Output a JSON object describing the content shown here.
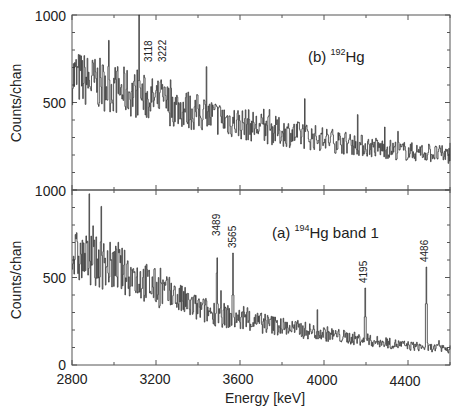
{
  "chart_data": [
    {
      "type": "line",
      "panel": "b",
      "title": "(b) 192Hg",
      "title_parts": {
        "prefix": "(b) ",
        "mass": "192",
        "element": "Hg"
      },
      "xlabel": "Energy [keV]",
      "ylabel": "Counts/chan",
      "xlim": [
        2800,
        4600
      ],
      "ylim": [
        0,
        1000
      ],
      "yticks": [
        {
          "value": 500,
          "label": "500"
        },
        {
          "value": 1000,
          "label": "1000"
        }
      ],
      "bottom_label": "1000",
      "peaks": [
        {
          "energy": 3118,
          "label": "3118",
          "counts": 1000
        },
        {
          "energy": 3222,
          "label": "3222",
          "counts": 720
        }
      ],
      "background_trend": {
        "x": [
          2800,
          3000,
          3200,
          3400,
          3600,
          3800,
          4000,
          4200,
          4400,
          4600
        ],
        "y": [
          650,
          580,
          510,
          440,
          380,
          330,
          290,
          250,
          220,
          200
        ]
      }
    },
    {
      "type": "line",
      "panel": "a",
      "title": "(a) 194Hg band 1",
      "title_parts": {
        "prefix": "(a) ",
        "mass": "194",
        "element": "Hg band 1"
      },
      "xlabel": "Energy [keV]",
      "ylabel": "Counts/chan",
      "xlim": [
        2800,
        4600
      ],
      "ylim": [
        0,
        1000
      ],
      "xticks": [
        2800,
        3200,
        3600,
        4000,
        4400
      ],
      "xtick_labels": [
        "2800",
        "3200",
        "3600",
        "4000",
        "4400"
      ],
      "yticks": [
        {
          "value": 0,
          "label": "0"
        },
        {
          "value": 500,
          "label": "500"
        },
        {
          "value": 1000,
          "label": "1000"
        }
      ],
      "peaks": [
        {
          "energy": 3489,
          "label": "3489",
          "counts": 700
        },
        {
          "energy": 3565,
          "label": "3565",
          "counts": 640
        },
        {
          "energy": 4195,
          "label": "4195",
          "counts": 440
        },
        {
          "energy": 4486,
          "label": "4486",
          "counts": 560
        }
      ],
      "background_trend": {
        "x": [
          2800,
          3000,
          3200,
          3400,
          3600,
          3800,
          4000,
          4200,
          4400,
          4600
        ],
        "y": [
          620,
          560,
          440,
          320,
          260,
          220,
          180,
          140,
          110,
          90
        ]
      }
    }
  ],
  "axis": {
    "xlabel": "Energy [keV]",
    "ylabel_top": "Counts/chan",
    "ylabel_bottom": "Counts/chan",
    "xtick_labels": [
      "2800",
      "3200",
      "3600",
      "4000",
      "4400"
    ],
    "top_y_labels": [
      "1000",
      "500",
      "1000"
    ],
    "bottom_y_labels": [
      "500",
      "0"
    ]
  },
  "panels": {
    "b": {
      "prefix": "(b) ",
      "mass": "192",
      "element": "Hg",
      "peak_labels": [
        "3118",
        "3222"
      ]
    },
    "a": {
      "prefix": "(a) ",
      "mass": "194",
      "element": "Hg band 1",
      "peak_labels": [
        "3489",
        "3565",
        "4195",
        "4486"
      ]
    }
  },
  "colors": {
    "line": "#333333",
    "frame": "#555555",
    "text": "#222222"
  }
}
